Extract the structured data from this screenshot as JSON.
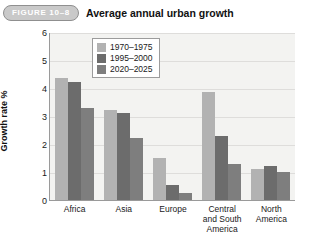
{
  "figure": {
    "badge": "FIGURE 10–8",
    "title": "Average annual urban growth"
  },
  "chart_data": {
    "type": "bar",
    "title": "Average annual urban growth",
    "xlabel": "",
    "ylabel": "Growth rate %",
    "ylim": [
      0,
      6
    ],
    "yticks": [
      "0",
      "1",
      "2",
      "3",
      "4",
      "5",
      "6"
    ],
    "grid": true,
    "legend_position": "top-center",
    "categories": [
      "Africa",
      "Asia",
      "Europe",
      "Central and South America",
      "North America"
    ],
    "category_lines": [
      [
        "Africa"
      ],
      [
        "Asia"
      ],
      [
        "Europe"
      ],
      [
        "Central",
        "and South",
        "America"
      ],
      [
        "North",
        "America"
      ]
    ],
    "series": [
      {
        "name": "1970–1975",
        "color": "#b2b2b2",
        "values": [
          4.35,
          3.2,
          1.5,
          3.85,
          1.1
        ]
      },
      {
        "name": "1995–2000",
        "color": "#6c6c6c",
        "values": [
          4.2,
          3.1,
          0.55,
          2.3,
          1.2
        ]
      },
      {
        "name": "2020–2025",
        "color": "#7e7e7e",
        "values": [
          3.3,
          2.2,
          0.25,
          1.3,
          1.0
        ]
      }
    ]
  }
}
